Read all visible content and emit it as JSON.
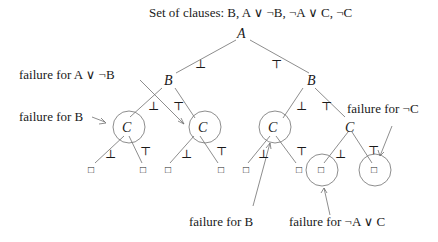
{
  "title": "Set of clauses: B, A ∨ ¬B, ¬A ∨ C, ¬C",
  "nodes": {
    "root": "A",
    "b_left": "B",
    "b_right": "B",
    "c1": "C",
    "c2": "C",
    "c3": "C",
    "c4": "C"
  },
  "edge_labels": {
    "false": "⊥",
    "true": "⊤"
  },
  "leaf_symbol": "□",
  "annotations": {
    "fail_a_or_not_b": "failure for A ∨ ¬B",
    "fail_b_left": "failure for B",
    "fail_not_c": "failure for ¬C",
    "fail_b_bottom": "failure for B",
    "fail_not_a_or_c": "failure for ¬A ∨ C"
  },
  "colors": {
    "line": "#707070",
    "text": "#1a1a1a"
  }
}
